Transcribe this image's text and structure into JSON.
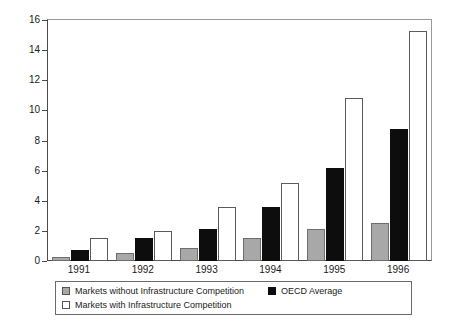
{
  "chart_data": {
    "type": "bar",
    "title": "",
    "subtitle": "",
    "xlabel": "",
    "ylabel": "",
    "categories": [
      "1991",
      "1992",
      "1993",
      "1994",
      "1995",
      "1996"
    ],
    "series": [
      {
        "name": "Markets without Infrastructure Competition",
        "color": "#a8a8a8",
        "values": [
          0.25,
          0.5,
          0.85,
          1.5,
          2.15,
          2.55
        ]
      },
      {
        "name": "OECD Average",
        "color": "#0d0d0d",
        "values": [
          0.75,
          1.5,
          2.1,
          3.6,
          6.2,
          8.75
        ]
      },
      {
        "name": "Markets with Infrastructure Competition",
        "color": "#ffffff",
        "values": [
          1.5,
          2.0,
          3.6,
          5.15,
          10.8,
          15.25
        ]
      }
    ],
    "ylim": [
      0,
      16
    ],
    "yticks": [
      0,
      2,
      4,
      6,
      8,
      10,
      12,
      14,
      16
    ],
    "ytick_labels": [
      "0",
      "2",
      "4",
      "6",
      "8",
      "10",
      "12",
      "14",
      "16"
    ],
    "grid": false,
    "legend_position": "below-plot"
  },
  "legend": {
    "entries": [
      {
        "swatch": "gray-swatch",
        "label": "Markets without Infrastructure Competition"
      },
      {
        "swatch": "white-swatch",
        "label": "Markets with Infrastructure Competition"
      },
      {
        "swatch": "black-swatch",
        "label": "OECD Average"
      }
    ]
  }
}
